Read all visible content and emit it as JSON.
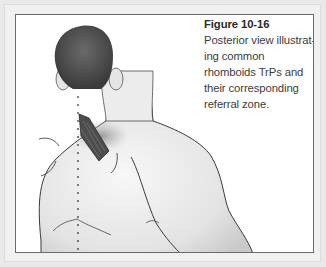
{
  "figure": {
    "label": "Figure 10-16",
    "caption": "Posterior view illustrating common rhomboids TrPs and their corresponding referral zone.",
    "caption_lines": [
      "Posterior view illustrat-",
      "ing common rhomboids TrPs and",
      "their corresponding referral zone."
    ],
    "illustration": "posterior-view-upper-back-rhomboids",
    "colors": {
      "frame_outer": "#e9e9e9",
      "frame_border": "#6a6a6a",
      "muscle": "#4a4a4a",
      "referral_zone": "#9a9a9a"
    }
  }
}
